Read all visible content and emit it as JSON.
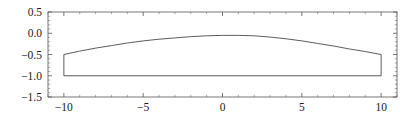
{
  "figure": {
    "background_color": "#ffffff",
    "frame_color": "#555555",
    "curve_color": "#4a4a4a",
    "frame_px": {
      "left": 48,
      "top": 12,
      "right": 397,
      "bottom": 97
    }
  },
  "chart_data": {
    "type": "line",
    "title": "",
    "xlabel": "",
    "ylabel": "",
    "xlim": [
      -11.0,
      11.0
    ],
    "ylim": [
      -1.5,
      0.5
    ],
    "grid": false,
    "legend": null,
    "frame": true,
    "ticks_on_all_sides": true,
    "xticks": [
      -10,
      -5,
      0,
      5,
      10
    ],
    "xtick_labels": [
      "-10",
      "-5",
      "0",
      "5",
      "10"
    ],
    "xtick_minor_step": 1,
    "yticks": [
      0.5,
      0.0,
      -0.5,
      -1.0,
      -1.5
    ],
    "ytick_labels": [
      "0.5",
      "0.0",
      "-0.5",
      "-1.0",
      "-1.5"
    ],
    "ytick_minor_step": 0.1,
    "series": [
      {
        "name": "closed-region-outline",
        "closed": true,
        "description": "Closed region: curved upper arc from (-10,-0.5) peaking near (0,-0.05) to (10,-0.5); vertical right edge down to (10,-1.0); flat base back to (-10,-1.0); vertical left edge up to (-10,-0.5).",
        "x": [
          -10,
          -9,
          -8,
          -7,
          -6,
          -5,
          -4,
          -3,
          -2,
          -1,
          0,
          1,
          2,
          3,
          4,
          5,
          6,
          7,
          8,
          9,
          10,
          10,
          -10,
          -10
        ],
        "y": [
          -0.5,
          -0.42,
          -0.35,
          -0.29,
          -0.23,
          -0.18,
          -0.14,
          -0.11,
          -0.08,
          -0.06,
          -0.05,
          -0.05,
          -0.06,
          -0.09,
          -0.13,
          -0.18,
          -0.24,
          -0.3,
          -0.37,
          -0.43,
          -0.5,
          -1.0,
          -1.0,
          -0.5
        ]
      }
    ],
    "upper_curve": {
      "x": [
        -10,
        -9,
        -8,
        -7,
        -6,
        -5,
        -4,
        -3,
        -2,
        -1,
        0,
        1,
        2,
        3,
        4,
        5,
        6,
        7,
        8,
        9,
        10
      ],
      "y": [
        -0.5,
        -0.42,
        -0.35,
        -0.29,
        -0.23,
        -0.18,
        -0.14,
        -0.11,
        -0.08,
        -0.06,
        -0.05,
        -0.05,
        -0.06,
        -0.09,
        -0.13,
        -0.18,
        -0.24,
        -0.3,
        -0.37,
        -0.43,
        -0.5
      ]
    },
    "lower_edge": {
      "x": [
        -10,
        10
      ],
      "y": [
        -1.0,
        -1.0
      ]
    },
    "left_edge": {
      "x": [
        -10,
        -10
      ],
      "y": [
        -0.5,
        -1.0
      ]
    },
    "right_edge": {
      "x": [
        10,
        10
      ],
      "y": [
        -0.5,
        -1.0
      ]
    }
  }
}
